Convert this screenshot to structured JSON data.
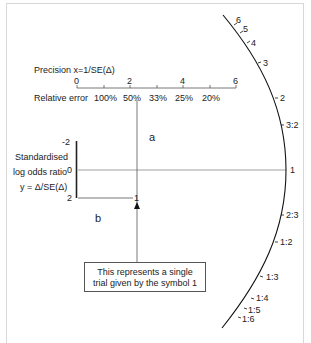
{
  "diagram": {
    "type": "radial (Galbraith) plot explanation",
    "precision_axis": {
      "title": "Precision x=1/SE(Δ)",
      "ticks": [
        "0",
        "2",
        "4",
        "6"
      ],
      "relative_error_label": "Relative error",
      "relative_error_ticks": [
        "100%",
        "50%",
        "33%",
        "25%",
        "20%"
      ]
    },
    "y_axis": {
      "label_line1": "Standardised",
      "label_line2": "log odds ratio",
      "label_line3": "y = Δ/SE(Δ)",
      "ticks": [
        "-2",
        "0",
        "2"
      ]
    },
    "region_labels": {
      "a": "a",
      "b": "b"
    },
    "trial_point": {
      "symbol": "1"
    },
    "callout": {
      "line1": "This represents a single",
      "line2": "trial given by the symbol 1"
    },
    "arc_scale": {
      "labels": [
        "6",
        "5",
        "4",
        "3",
        "2",
        "3:2",
        "1",
        "2:3",
        "1:2",
        "1:3",
        "1:4",
        "1:5",
        "1:6"
      ]
    }
  }
}
